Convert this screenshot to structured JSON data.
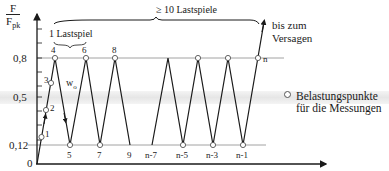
{
  "y_axis": {
    "label_numerator": "F",
    "label_denominator": "F",
    "label_denominator_sub": "pk",
    "ticks": [
      {
        "label": "0,8",
        "value": 0.8
      },
      {
        "label": "0,5",
        "value": 0.5
      },
      {
        "label": "0,12",
        "value": 0.12
      },
      {
        "label": "0",
        "value": 0
      }
    ]
  },
  "annotations": {
    "one_cycle": "1 Lastspiel",
    "ten_cycles": "≥ 10 Lastspiele",
    "until_failure_line1": "bis zum",
    "until_failure_line2": "Versagen",
    "w0": "w",
    "w0_sub": "o"
  },
  "points": {
    "p1": "1",
    "p2": "2",
    "p3": "3",
    "p4": "4",
    "p5": "5",
    "p6": "6",
    "p7": "7",
    "p8": "8",
    "p9": "9",
    "pn7": "n-7",
    "pn5": "n-5",
    "pn3": "n-3",
    "pn1": "n-1",
    "pn": "n"
  },
  "legend": {
    "line1": "Belastungspunkte",
    "line2": "für die Messungen"
  },
  "colors": {
    "line": "#1a1a1a",
    "reference_line": "#8a8a8a",
    "band": "#e6e6e6"
  }
}
